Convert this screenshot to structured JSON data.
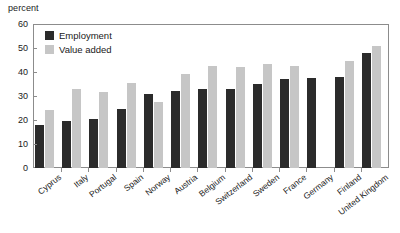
{
  "chart_data": {
    "type": "bar",
    "title": "",
    "subtitle": "",
    "xlabel": "",
    "ylabel": "percent",
    "ylim": [
      0,
      60
    ],
    "yticks": [
      0,
      10,
      20,
      30,
      40,
      50,
      60
    ],
    "grid": false,
    "legend_position": "top-left",
    "categories": [
      "Cyprus",
      "Italy",
      "Portugal",
      "Spain",
      "Norway",
      "Austria",
      "Belgium",
      "Switzerland",
      "Sweden",
      "France",
      "Germany",
      "Finland",
      "United Kingdom"
    ],
    "series": [
      {
        "name": "Employment",
        "color": "#2b2b2b",
        "values": [
          18,
          19.5,
          20.5,
          24.5,
          31,
          32,
          33,
          33,
          35,
          37,
          37.5,
          38,
          48
        ]
      },
      {
        "name": "Value added",
        "color": "#c6c6c6",
        "values": [
          24,
          33,
          31.5,
          35.5,
          27.5,
          39,
          42.5,
          42,
          43.5,
          42.5,
          null,
          44.5,
          51
        ]
      }
    ]
  },
  "legend": {
    "items": [
      {
        "label": "Employment",
        "color": "#2b2b2b"
      },
      {
        "label": "Value added",
        "color": "#c6c6c6"
      }
    ]
  },
  "axis": {
    "unit_label": "percent"
  }
}
